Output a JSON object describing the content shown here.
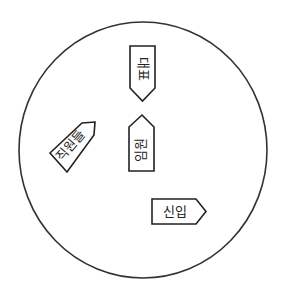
{
  "diagram": {
    "circle": {
      "cx": 143,
      "cy": 150,
      "rx": 124,
      "ry": 128,
      "stroke": "#333333"
    },
    "tags": [
      {
        "id": "top",
        "label": "대표",
        "direction": "down"
      },
      {
        "id": "middle",
        "label": "임원",
        "direction": "up"
      },
      {
        "id": "left",
        "label": "직원들",
        "direction": "up-right"
      },
      {
        "id": "right",
        "label": "신입",
        "direction": "right"
      }
    ]
  }
}
